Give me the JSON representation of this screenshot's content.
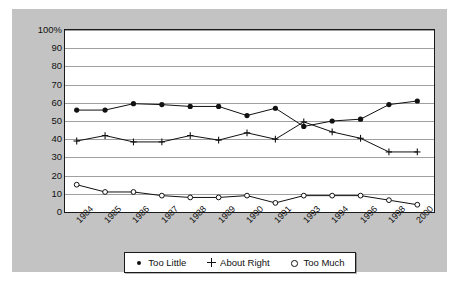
{
  "chart_data": {
    "type": "line",
    "title": "",
    "subtitle": "",
    "xlabel": "",
    "ylabel": "",
    "ylim": [
      0,
      100
    ],
    "grid": true,
    "legend_position": "bottom",
    "categories": [
      "1984",
      "1985",
      "1986",
      "1987",
      "1988",
      "1989",
      "1990",
      "1991",
      "1993",
      "1994",
      "1996",
      "1998",
      "2000"
    ],
    "ytick_labels": [
      "100%",
      "90",
      "80",
      "70",
      "60",
      "50",
      "40",
      "30",
      "20",
      "10",
      "0"
    ],
    "ytick_values": [
      100,
      90,
      80,
      70,
      60,
      50,
      40,
      30,
      20,
      10,
      0
    ],
    "series": [
      {
        "name": "Too Little",
        "marker": "filled-circle",
        "color": "#111111",
        "values": [
          56,
          56,
          59.5,
          59,
          58,
          58,
          53,
          57,
          47,
          50,
          51,
          59,
          61
        ]
      },
      {
        "name": "About Right",
        "marker": "plus",
        "color": "#111111",
        "values": [
          39,
          42,
          38.5,
          38.5,
          42,
          39.5,
          43.5,
          40,
          49.5,
          44,
          40.5,
          33,
          33
        ]
      },
      {
        "name": "Too Much",
        "marker": "open-circle",
        "color": "#111111",
        "values": [
          15,
          11,
          11,
          9,
          8,
          8,
          9,
          5,
          9,
          9,
          9,
          6.5,
          4
        ]
      }
    ]
  },
  "legend": {
    "items": [
      {
        "label": "Too Little",
        "marker": "filled-circle"
      },
      {
        "label": "About Right",
        "marker": "plus"
      },
      {
        "label": "Too Much",
        "marker": "open-circle"
      }
    ]
  },
  "colors": {
    "panel_background": "#c3c3c3",
    "plot_background": "#ffffff",
    "axis": "#1a1a1a",
    "gridline": "#8f8f8f",
    "series": "#111111"
  }
}
